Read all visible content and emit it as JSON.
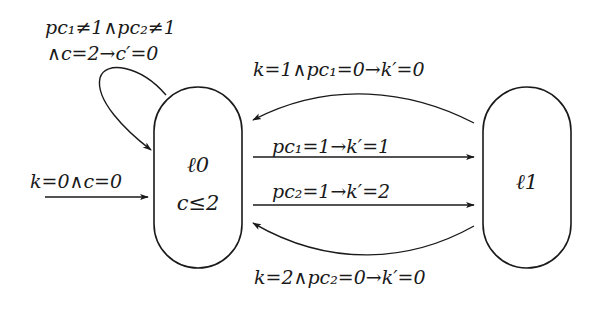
{
  "diagram": {
    "type": "timed-automaton",
    "states": [
      {
        "id": "l0",
        "name": "ℓ0",
        "invariant": "c≤2"
      },
      {
        "id": "l1",
        "name": "ℓ1"
      }
    ],
    "initial": {
      "target": "l0",
      "label": "k=0∧c=0"
    },
    "transitions": [
      {
        "id": "self-loop",
        "from": "l0",
        "to": "l0",
        "label_line1": "pc₁≠1∧pc₂≠1",
        "label_line2": "∧c=2→c′=0"
      },
      {
        "id": "l1-to-l0-top",
        "from": "l1",
        "to": "l0",
        "label": "k=1∧pc₁=0→k′=0"
      },
      {
        "id": "l0-to-l1-pc1",
        "from": "l0",
        "to": "l1",
        "label": "pc₁=1→k′=1"
      },
      {
        "id": "l0-to-l1-pc2",
        "from": "l0",
        "to": "l1",
        "label": "pc₂=1→k′=2"
      },
      {
        "id": "l1-to-l0-bottom",
        "from": "l1",
        "to": "l0",
        "label": "k=2∧pc₂=0→k′=0"
      }
    ],
    "colors": {
      "stroke": "#1a1a1a",
      "background": "#ffffff"
    }
  }
}
